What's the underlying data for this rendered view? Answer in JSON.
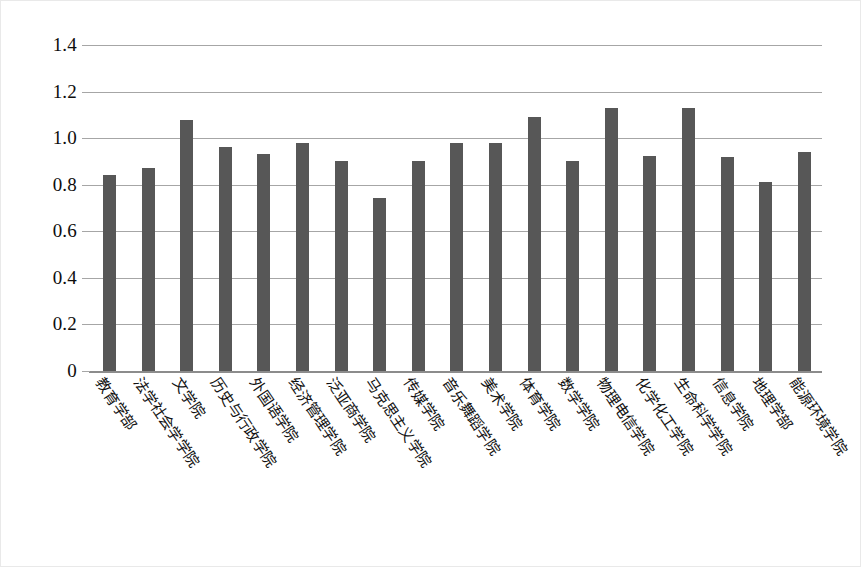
{
  "chart_data": {
    "type": "bar",
    "title": "",
    "subtitle": "",
    "xlabel": "",
    "ylabel": "",
    "ylim": [
      0,
      1.4
    ],
    "grid": true,
    "legend": false,
    "legend_position": "none",
    "bar_color": "#575757",
    "gridline_color": "#a6a6a6",
    "axis_color": "#8c8c8c",
    "background": "#ffffff",
    "y_ticks": [
      "0",
      "0.2",
      "0.4",
      "0.6",
      "0.8",
      "1.0",
      "1.2",
      "1.4"
    ],
    "y_tick_values": [
      0,
      0.2,
      0.4,
      0.6,
      0.8,
      1.0,
      1.2,
      1.4
    ],
    "categories": [
      "教育学部",
      "法学社会学学院",
      "文学院",
      "历史与行政学院",
      "外国语学院",
      "经济管理学院",
      "泛亚商学院",
      "马克思主义学院",
      "传媒学院",
      "音乐舞蹈学院",
      "美术学院",
      "体育学院",
      "数学学院",
      "物理电信学院",
      "化学化工学院",
      "生命科学学院",
      "信息学院",
      "地理学部",
      "能源环境学院"
    ],
    "values": [
      0.84,
      0.87,
      1.08,
      0.96,
      0.93,
      0.98,
      0.9,
      0.745,
      0.9,
      0.98,
      0.98,
      1.09,
      0.9,
      1.13,
      0.925,
      1.13,
      0.92,
      0.81,
      0.94
    ]
  }
}
